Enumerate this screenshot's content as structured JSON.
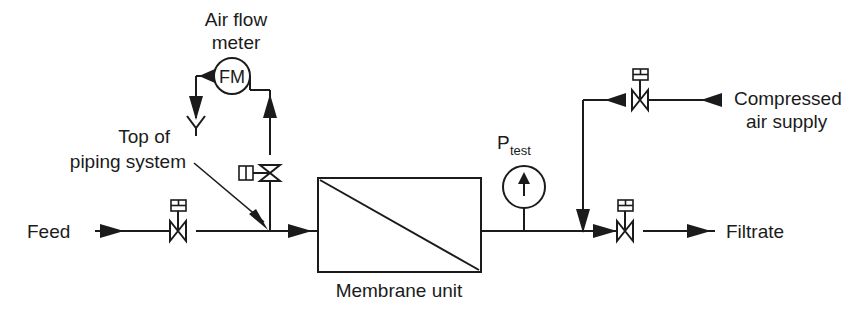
{
  "diagram": {
    "background_color": "#ffffff",
    "line_color": "#1b1b1b",
    "labels": {
      "air_flow_meter_line1": "Air flow",
      "air_flow_meter_line2": "meter",
      "flow_meter_tag": "FM",
      "top_of_piping_line1": "Top of",
      "top_of_piping_line2": "piping system",
      "feed": "Feed",
      "membrane_unit": "Membrane unit",
      "pressure_test_symbol": "P",
      "pressure_test_subscript": "test",
      "compressed_air_line1": "Compressed",
      "compressed_air_line2": "air supply",
      "filtrate": "Filtrate"
    },
    "components": [
      {
        "name": "feed-valve",
        "type": "diaphragm-valve",
        "orientation": "horizontal"
      },
      {
        "name": "air-branch-valve",
        "type": "diaphragm-valve",
        "orientation": "vertical"
      },
      {
        "name": "air-flow-meter",
        "type": "instrument-circle",
        "tag": "FM"
      },
      {
        "name": "vent",
        "type": "vent-to-atmosphere"
      },
      {
        "name": "membrane-unit",
        "type": "vessel-rectangle"
      },
      {
        "name": "pressure-gauge",
        "type": "instrument-circle",
        "tag": "P test"
      },
      {
        "name": "compressed-air-valve",
        "type": "diaphragm-valve",
        "orientation": "horizontal"
      },
      {
        "name": "filtrate-valve",
        "type": "diaphragm-valve",
        "orientation": "horizontal"
      }
    ],
    "flow_directions": [
      {
        "name": "feed-inlet",
        "direction": "right"
      },
      {
        "name": "to-membrane",
        "direction": "right"
      },
      {
        "name": "air-to-meter",
        "direction": "up"
      },
      {
        "name": "meter-to-vent",
        "direction": "left"
      },
      {
        "name": "vent-discharge",
        "direction": "down"
      },
      {
        "name": "branch-to-main",
        "direction": "down"
      },
      {
        "name": "compressed-air-inlet",
        "direction": "left"
      },
      {
        "name": "air-down-to-filtrate",
        "direction": "down"
      },
      {
        "name": "filtrate-outlet",
        "direction": "right"
      }
    ]
  }
}
